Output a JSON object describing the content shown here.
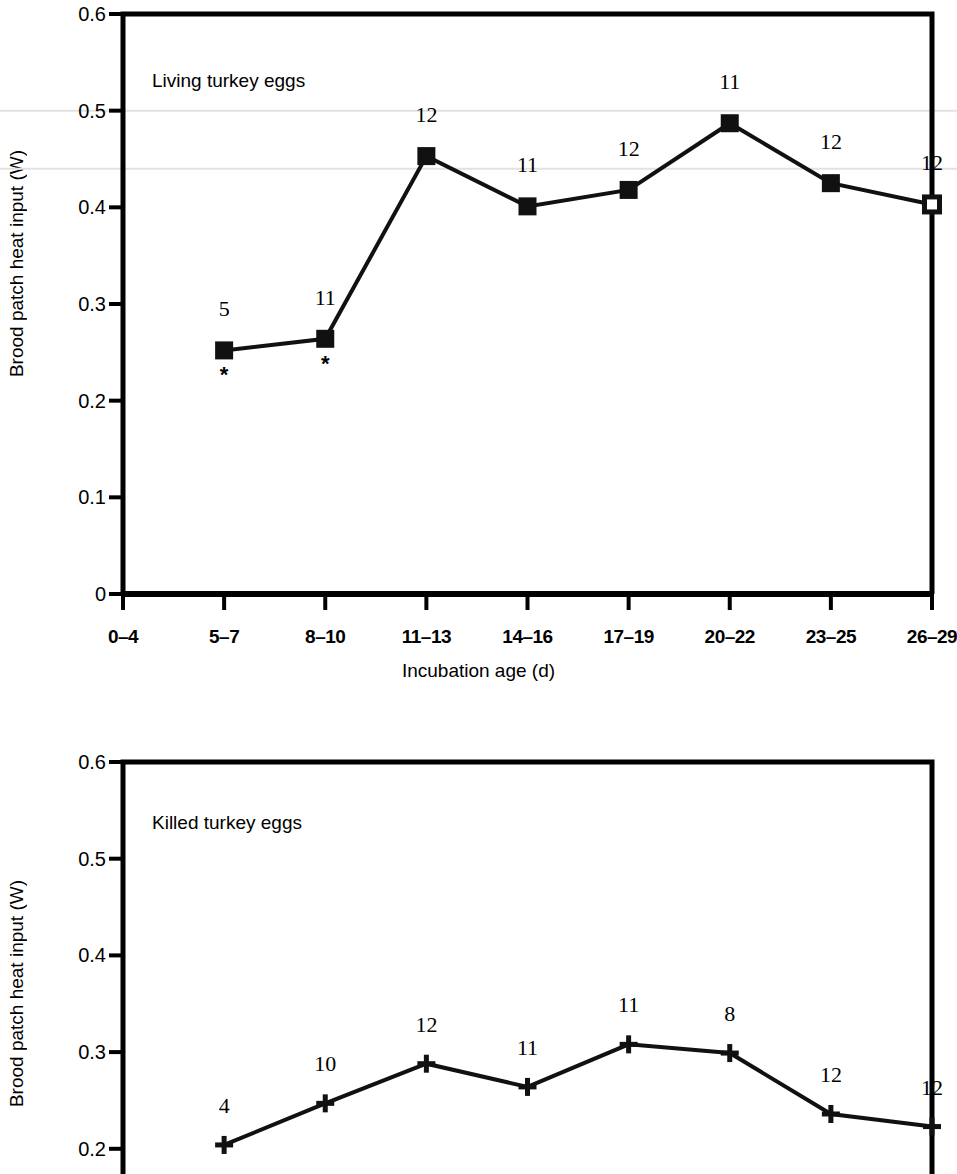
{
  "figure": {
    "axis_label_y": "Brood patch heat input (W)",
    "axis_label_x": "Incubation age (d)",
    "line_color": "#111111",
    "gridline_color": "#e2e2e2",
    "axis_color": "#000000"
  },
  "chart_data": [
    {
      "type": "line",
      "title": "Living turkey eggs",
      "xlabel": "Incubation age (d)",
      "ylabel": "Brood patch heat input (W)",
      "categories": [
        "0–4",
        "5–7",
        "8–10",
        "11–13",
        "14–16",
        "17–19",
        "20–22",
        "23–25",
        "26–29"
      ],
      "yticks": [
        "0",
        "0.1",
        "0.2",
        "0.3",
        "0.4",
        "0.5",
        "0.6"
      ],
      "ytick_values": [
        0,
        0.1,
        0.2,
        0.3,
        0.4,
        0.5,
        0.6
      ],
      "ylim": [
        0,
        0.6
      ],
      "grid": "faint horizontal gridlines at 0.5 and 0.44",
      "legend": "none",
      "marker": "filled-square",
      "values": [
        null,
        0.252,
        0.264,
        0.453,
        0.401,
        0.418,
        0.487,
        0.425,
        0.403
      ],
      "point_labels": [
        null,
        "5",
        "11",
        "12",
        "11",
        "12",
        "11",
        "12",
        "12"
      ],
      "significance_marks": [
        null,
        "*",
        "*",
        null,
        null,
        null,
        null,
        null,
        null
      ],
      "notes": "Sample sizes (n) shown above each point; asterisks denote significance at 5-7 and 8-10 d"
    },
    {
      "type": "line",
      "title": "Killed turkey eggs",
      "xlabel": "Incubation age (d)",
      "ylabel": "Brood patch heat input (W)",
      "categories": [
        "0–4",
        "5–7",
        "8–10",
        "11–13",
        "14–16",
        "17–19",
        "20–22",
        "23–25",
        "26–29"
      ],
      "yticks": [
        "0.2",
        "0.3",
        "0.4",
        "0.5",
        "0.6"
      ],
      "ytick_values": [
        0.2,
        0.3,
        0.4,
        0.5,
        0.6
      ],
      "ylim": [
        0.19,
        0.6
      ],
      "grid": "none visible",
      "legend": "none",
      "marker": "plus",
      "values": [
        null,
        0.204,
        0.247,
        0.288,
        0.264,
        0.308,
        0.299,
        0.236,
        0.223
      ],
      "point_labels": [
        null,
        "4",
        "10",
        "12",
        "11",
        "11",
        "8",
        "12",
        "12"
      ],
      "significance_marks": [
        null,
        null,
        null,
        null,
        null,
        null,
        null,
        null,
        null
      ],
      "notes": "Panel is cropped at the bottom edge of the image below ~0.19 W"
    }
  ]
}
